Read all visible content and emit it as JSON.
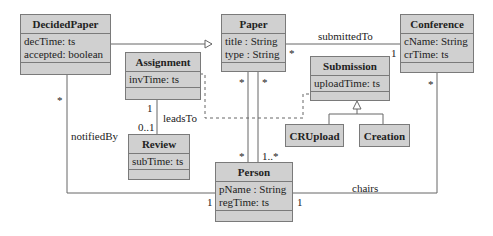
{
  "classes": {
    "decided_paper": {
      "name": "DecidedPaper",
      "attrs": [
        "decTime: ts",
        "accepted: boolean"
      ]
    },
    "paper": {
      "name": "Paper",
      "attrs": [
        "title : String",
        "type : String"
      ]
    },
    "conference": {
      "name": "Conference",
      "attrs": [
        "cName: String",
        "crTime: ts"
      ]
    },
    "assignment": {
      "name": "Assignment",
      "attrs": [
        "invTime: ts"
      ]
    },
    "submission": {
      "name": "Submission",
      "attrs": [
        "uploadTime: ts"
      ]
    },
    "review": {
      "name": "Review",
      "attrs": [
        "subTime: ts"
      ]
    },
    "cr_upload": {
      "name": "CRUpload"
    },
    "creation": {
      "name": "Creation"
    },
    "person": {
      "name": "Person",
      "attrs": [
        "pName : String",
        "regTime: ts"
      ]
    }
  },
  "associations": {
    "submitted_to": {
      "label": "submittedTo",
      "paper_mult": "*",
      "conference_mult": "1"
    },
    "leads_to": {
      "label": "leadsTo",
      "assignment_mult": "1",
      "review_mult": "0..1"
    },
    "notified_by": {
      "label": "notifiedBy",
      "decided_mult": "*",
      "person_mult": "1"
    },
    "chairs": {
      "label": "chairs",
      "person_mult": "1",
      "conference_mult": "*"
    },
    "paper_person_a": {
      "paper_mult": "*",
      "person_mult": "*"
    },
    "paper_person_b": {
      "paper_mult": "*",
      "person_mult": "1..*"
    }
  },
  "colors": {
    "class_fill": "#d0d0d0",
    "border": "#7a7a7a",
    "line": "#666666"
  }
}
